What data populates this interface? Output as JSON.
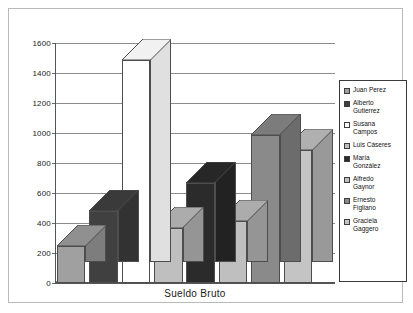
{
  "chart": {
    "x_title": "Sueldo Bruto"
  },
  "legend": {
    "position": "right",
    "entries": [
      {
        "label": "Juan Perez",
        "color": "#a0a0a0",
        "swatch_name": "legend-swatch-juan-perez"
      },
      {
        "label": "Alberto\nGutierrez",
        "color": "#404040",
        "swatch_name": "legend-swatch-alberto-gutierrez"
      },
      {
        "label": "Susana\nCampos",
        "color": "#ffffff",
        "swatch_name": "legend-swatch-susana-campos"
      },
      {
        "label": "Luis Cáseres",
        "color": "#bfbfbf",
        "swatch_name": "legend-swatch-luis-caseres"
      },
      {
        "label": "María\nGonzález",
        "color": "#2b2b2b",
        "swatch_name": "legend-swatch-maria-gonzalez"
      },
      {
        "label": "Alfredo\nGaynor",
        "color": "#bfbfbf",
        "swatch_name": "legend-swatch-alfredo-gaynor"
      },
      {
        "label": "Ernesto\nFigliano",
        "color": "#8a8a8a",
        "swatch_name": "legend-swatch-ernesto-figliano"
      },
      {
        "label": "Graciela\nGaggero",
        "color": "#c4c4c4",
        "swatch_name": "legend-swatch-graciela-gaggero"
      }
    ]
  },
  "axis": {
    "y_ticks": [
      "1600",
      "1400",
      "1200",
      "1000",
      "800",
      "600",
      "400",
      "200",
      "0"
    ]
  },
  "chart_data": {
    "type": "bar",
    "title": "",
    "subtitle": "",
    "xlabel": "Sueldo Bruto",
    "ylabel": "",
    "ylim": [
      0,
      1600
    ],
    "ytick_step": 200,
    "grid": true,
    "legend_position": "right",
    "three_d": true,
    "categories": [
      "Juan Perez",
      "Alberto Gutierrez",
      "Susana Campos",
      "Luis Cáseres",
      "María González",
      "Alfredo Gaynor",
      "Ernesto Figliano",
      "Graciela Gaggero"
    ],
    "values": [
      250,
      480,
      1490,
      370,
      670,
      415,
      990,
      890
    ],
    "colors": [
      "#a0a0a0",
      "#404040",
      "#ffffff",
      "#bfbfbf",
      "#2b2b2b",
      "#bfbfbf",
      "#8a8a8a",
      "#c4c4c4"
    ]
  }
}
